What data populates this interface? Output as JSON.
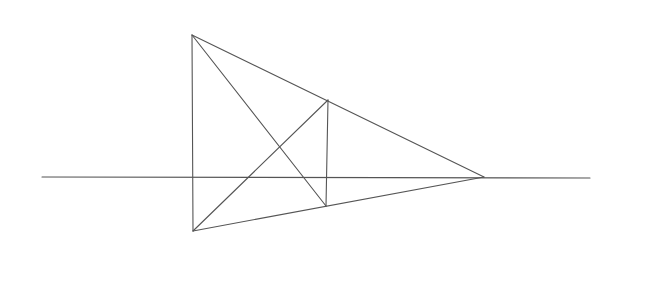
{
  "diagram": {
    "stroke_color": "#555555",
    "background": "#ffffff",
    "points": {
      "A": [
        192,
        35
      ],
      "B": [
        193,
        231
      ],
      "C": [
        328,
        100
      ],
      "D": [
        326,
        206
      ],
      "E": [
        484,
        177
      ]
    },
    "horizon": {
      "x1": 42,
      "y1": 177,
      "x2": 590,
      "y2": 178
    },
    "segments": [
      [
        "A",
        "B"
      ],
      [
        "A",
        "E"
      ],
      [
        "B",
        "E"
      ],
      [
        "C",
        "D"
      ],
      [
        "A",
        "D"
      ],
      [
        "B",
        "C"
      ]
    ]
  }
}
